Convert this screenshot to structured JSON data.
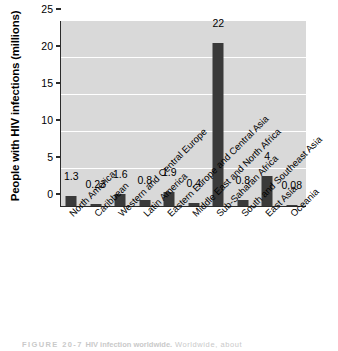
{
  "chart_data": {
    "type": "bar",
    "title": "",
    "xlabel": "",
    "ylabel": "People with HIV infections (millions)",
    "ylim": [
      0,
      25
    ],
    "yticks": [
      0,
      5,
      10,
      15,
      20,
      25
    ],
    "grid": "horizontal-white",
    "legend": "none",
    "bar_color": "#3a3a3a",
    "plot_background": "#d9d9d9",
    "categories": [
      "North America",
      "Caribbean",
      "Western and Central Europe",
      "Latin America",
      "Eastern Europe and Central Asia",
      "Middle East and North Africa",
      "Sub-Saharan Africa",
      "South and Southeast Asia",
      "East Asia",
      "Oceania"
    ],
    "values": [
      1.3,
      0.23,
      1.6,
      0.8,
      1.9,
      0.4,
      22,
      0.8,
      4,
      0.08
    ],
    "value_labels": [
      "1.3",
      "0.23",
      "1.6",
      "0.8",
      "1.9",
      "0.4",
      "22",
      "0.8",
      "4",
      "0.08"
    ]
  },
  "caption": {
    "figure_number": "FIGURE 20-7",
    "title": "HIV infection worldwide.",
    "text": "Worldwide, about"
  }
}
